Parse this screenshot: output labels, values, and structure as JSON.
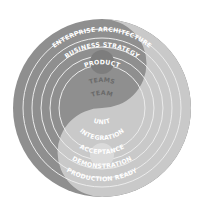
{
  "diagram": {
    "type": "concentric-yin-yang",
    "center": [
      102,
      108
    ],
    "outer_radius": 89,
    "ring_radii": [
      89,
      79,
      70,
      61,
      52,
      43,
      34
    ],
    "colors": {
      "light_half": "#c9c9c9",
      "dark_half": "#8f8f8f",
      "ring_line": "#efefef",
      "dot_light": "#d8d8d8",
      "dot_dark": "#7a7a7a",
      "text_on_light": "#ffffff",
      "text_on_dark": "#ffffff",
      "text_center_top": "#6a6a6a"
    },
    "top_labels": [
      "ENTERPRISE ARCHITECTURE",
      "BUSINESS STRATEGY",
      "PRODUCT",
      "TEAMS",
      "TEAM"
    ],
    "bottom_labels": [
      "UNIT",
      "INTEGRATION",
      "ACCEPTANCE",
      "DEMONSTRATION",
      "PRODUCTION READY"
    ]
  }
}
